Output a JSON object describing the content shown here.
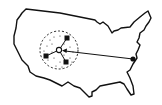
{
  "map": {
    "title": "United States distribution network",
    "region": "United States outline",
    "hub": {
      "label": "central hub",
      "x": 59,
      "y": 50
    },
    "spokes": [
      {
        "label": "node north-east",
        "x": 67,
        "y": 38
      },
      {
        "label": "node west",
        "x": 46,
        "y": 56
      },
      {
        "label": "node south-east",
        "x": 66,
        "y": 62
      }
    ],
    "origin": {
      "label": "east coast point",
      "x": 133,
      "y": 59
    },
    "colors": {
      "stroke": "#111111",
      "background": "#ffffff"
    }
  }
}
